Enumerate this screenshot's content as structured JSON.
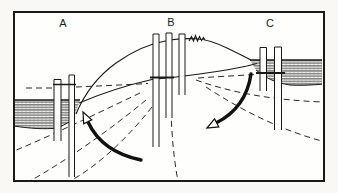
{
  "figure": {
    "site_labels": [
      "A",
      "B",
      "C"
    ],
    "colors": {
      "ink": "#1a1a1a",
      "paper": "#f9f8f5",
      "panel": "#fefefd"
    },
    "symbols": {
      "left_arrow": "curved-flow-arrow-up-left",
      "right_arrow": "curved-flow-arrow-down-left",
      "crest_mark": "surface-squiggle-mark",
      "band_fill": "aquifer-hatch-pattern"
    }
  }
}
